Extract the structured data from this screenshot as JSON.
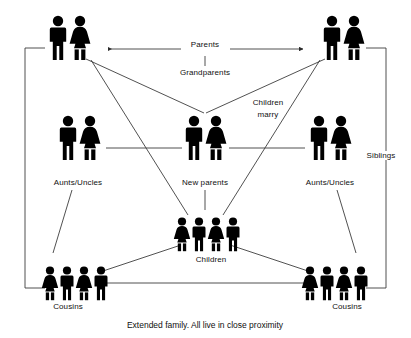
{
  "diagram": {
    "caption": "Extended family. All live in close proximity",
    "colors": {
      "figure": "#000000",
      "line": "#3d3d3d",
      "text": "#101010",
      "background": "#ffffff"
    },
    "nodes": [
      {
        "id": "grandparents-left",
        "label": "",
        "figures": [
          "man",
          "woman"
        ],
        "size": "adult",
        "x": 68,
        "y": 48
      },
      {
        "id": "grandparents-right",
        "label": "",
        "figures": [
          "man",
          "woman"
        ],
        "size": "adult",
        "x": 343,
        "y": 48
      },
      {
        "id": "aunts-uncles-left",
        "label": "Aunts/Uncles",
        "figures": [
          "man",
          "woman"
        ],
        "size": "adult",
        "x": 78,
        "y": 148
      },
      {
        "id": "new-parents",
        "label": "New parents",
        "figures": [
          "man",
          "woman"
        ],
        "size": "adult",
        "x": 205,
        "y": 148
      },
      {
        "id": "aunts-uncles-right",
        "label": "Aunts/Uncles",
        "figures": [
          "man",
          "woman"
        ],
        "size": "adult",
        "x": 330,
        "y": 148
      },
      {
        "id": "children",
        "label": "Children",
        "figures": [
          "girl",
          "boy",
          "girl",
          "boy"
        ],
        "size": "child",
        "x": 205,
        "y": 232
      },
      {
        "id": "cousins-left",
        "label": "Cousins",
        "figures": [
          "girl",
          "boy",
          "girl",
          "boy"
        ],
        "size": "child",
        "x": 65,
        "y": 278
      },
      {
        "id": "cousins-right",
        "label": "Cousins",
        "figures": [
          "girl",
          "boy",
          "girl",
          "boy"
        ],
        "size": "child",
        "x": 345,
        "y": 278
      }
    ],
    "edge_labels": [
      {
        "id": "parents-label",
        "text": "Parents",
        "x": 205,
        "y": 44
      },
      {
        "id": "grandparents-label",
        "text": "Grandparents",
        "x": 205,
        "y": 73
      },
      {
        "id": "children-marry-line1",
        "text": "Children",
        "x": 268,
        "y": 103
      },
      {
        "id": "children-marry-line2",
        "text": "marry",
        "x": 268,
        "y": 114
      },
      {
        "id": "siblings-label",
        "text": "Siblings",
        "x": 381,
        "y": 155
      }
    ],
    "node_labels": [
      {
        "id": "aunts-uncles-left-label",
        "text": "Aunts/Uncles",
        "x": 78,
        "y": 182
      },
      {
        "id": "new-parents-label",
        "text": "New parents",
        "x": 205,
        "y": 182
      },
      {
        "id": "aunts-uncles-right-label",
        "text": "Aunts/Uncles",
        "x": 330,
        "y": 182
      },
      {
        "id": "children-label",
        "text": "Children",
        "x": 211,
        "y": 259
      },
      {
        "id": "cousins-left-label",
        "text": "Cousins",
        "x": 68,
        "y": 306
      },
      {
        "id": "cousins-right-label",
        "text": "Cousins",
        "x": 347,
        "y": 306
      }
    ],
    "caption_pos": {
      "x": 205,
      "y": 323
    }
  }
}
